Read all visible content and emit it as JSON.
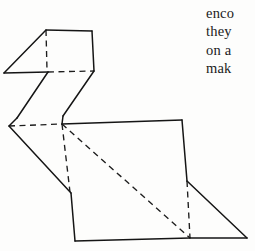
{
  "page": {
    "background_color": "#fdfdfc",
    "ink_color": "#151515",
    "width": 255,
    "height": 251
  },
  "text_block": {
    "name": "clipped-body-text",
    "note": "right margin text, horizontally clipped by page edge",
    "font_style": "serif",
    "color": "#1b1b1b",
    "lines": [
      {
        "text": "enco"
      },
      {
        "text": "they"
      },
      {
        "text": "on a"
      },
      {
        "text": "mak"
      }
    ]
  },
  "figure": {
    "line_styles": {
      "solid_label": "solid fold edge",
      "dashed_label": "dashed crease line",
      "solid_color": "#151515",
      "dashed_color": "#1d1d1d"
    },
    "solid_paths": [
      {
        "name": "beak-upper-edge",
        "d": "M 46 30 L 4 73"
      },
      {
        "name": "beak-lower-edge",
        "d": "M 4 73 L 48 72"
      },
      {
        "name": "head-top-edge",
        "d": "M 46 30 L 92 31"
      },
      {
        "name": "head-right-edge",
        "d": "M 92 31 L 94 71"
      },
      {
        "name": "neck-front-edge",
        "d": "M 48 72 L 17 118"
      },
      {
        "name": "neck-front-lower",
        "d": "M 17 118 L 9 126"
      },
      {
        "name": "neck-back-edge",
        "d": "M 94 71 L 63 116"
      },
      {
        "name": "neck-back-lower",
        "d": "M 63 116 L 62 124"
      },
      {
        "name": "body-left-upper",
        "d": "M 9 126 L 71 193"
      },
      {
        "name": "body-left-lower",
        "d": "M 71 193 L 75 241"
      },
      {
        "name": "body-bottom-edge",
        "d": "M 75 241 L 190 238"
      },
      {
        "name": "back-top-edge",
        "d": "M 62 124 L 182 120"
      },
      {
        "name": "body-right-edge",
        "d": "M 182 120 L 187 181"
      },
      {
        "name": "tail-upper-edge",
        "d": "M 187 181 L 247 238"
      },
      {
        "name": "tail-bottom-edge",
        "d": "M 190 238 L 247 238"
      }
    ],
    "dashed_paths": [
      {
        "name": "head-vertical-crease",
        "d": "M 46 30 L 47 70"
      },
      {
        "name": "head-bottom-crease",
        "d": "M 48 72 L 94 71"
      },
      {
        "name": "body-horizontal-crease",
        "d": "M 9 126 L 62 124"
      },
      {
        "name": "body-vertical-crease",
        "d": "M 62 124 L 70 192"
      },
      {
        "name": "body-long-diagonal-crease",
        "d": "M 62 124 L 190 238"
      },
      {
        "name": "tail-vertical-crease",
        "d": "M 187 181 L 190 238"
      }
    ]
  }
}
